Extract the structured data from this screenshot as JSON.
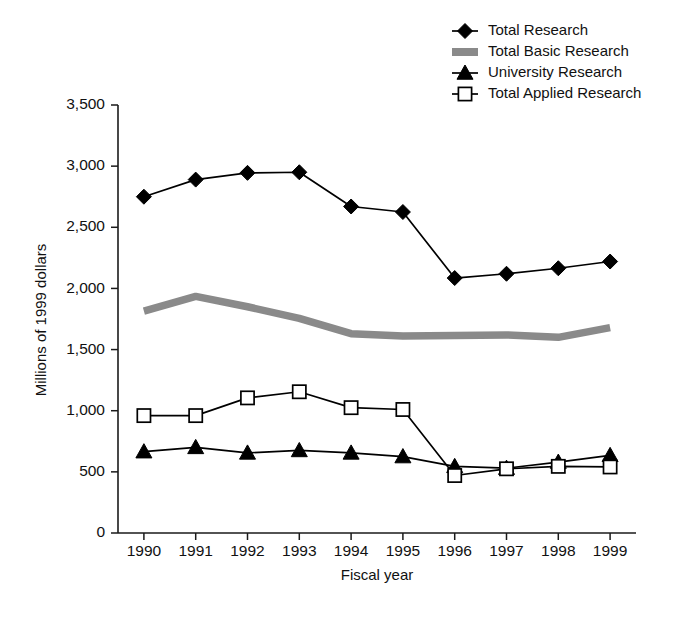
{
  "chart_data": {
    "type": "line",
    "title": "",
    "xlabel": "Fiscal year",
    "ylabel": "Millions of 1999 dollars",
    "categories": [
      "1990",
      "1991",
      "1992",
      "1993",
      "1994",
      "1995",
      "1996",
      "1997",
      "1998",
      "1999"
    ],
    "x": [
      1990,
      1991,
      1992,
      1993,
      1994,
      1995,
      1996,
      1997,
      1998,
      1999
    ],
    "ylim": [
      0,
      3500
    ],
    "yticks": [
      0,
      500,
      1000,
      1500,
      2000,
      2500,
      3000,
      3500
    ],
    "ytick_labels": [
      "0",
      "500",
      "1,000",
      "1,500",
      "2,000",
      "2,500",
      "3,000",
      "3,500"
    ],
    "grid": false,
    "legend_position": "top-right",
    "series": [
      {
        "name": "Total Research",
        "marker": "diamond-filled",
        "color": "#000000",
        "values": [
          2750,
          2890,
          2945,
          2950,
          2670,
          2625,
          2085,
          2120,
          2165,
          2220
        ]
      },
      {
        "name": "Total Basic Research",
        "marker": "none",
        "style": "thick-gray-band",
        "color": "#8a8a8a",
        "values": [
          1815,
          1935,
          1850,
          1755,
          1630,
          1610,
          1615,
          1620,
          1600,
          1680
        ]
      },
      {
        "name": "University Research",
        "marker": "triangle-filled",
        "color": "#000000",
        "values": [
          665,
          700,
          655,
          675,
          655,
          625,
          545,
          530,
          580,
          635
        ]
      },
      {
        "name": "Total Applied Research",
        "marker": "square-open",
        "color": "#000000",
        "values": [
          960,
          960,
          1105,
          1155,
          1025,
          1010,
          470,
          525,
          545,
          540
        ]
      }
    ]
  },
  "axes": {
    "y_title": "Millions of 1999 dollars",
    "x_title": "Fiscal year"
  },
  "legend": {
    "items": [
      {
        "label": "Total Research",
        "marker": "diamond-filled"
      },
      {
        "label": "Total Basic Research",
        "marker": "gray-band"
      },
      {
        "label": "University Research",
        "marker": "triangle-filled"
      },
      {
        "label": "Total Applied Research",
        "marker": "square-open"
      }
    ]
  },
  "colors": {
    "ink": "#000000",
    "band_gray": "#8a8a8a",
    "background": "#ffffff"
  }
}
